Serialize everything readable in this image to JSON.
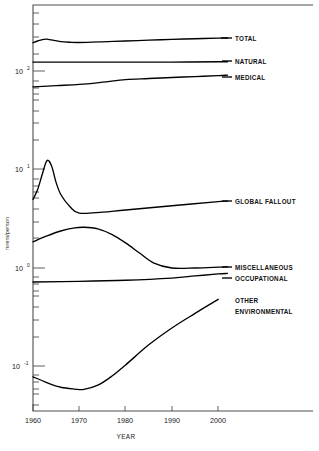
{
  "chart_data": {
    "type": "line",
    "title": "",
    "subtitle": "",
    "xlabel": "YEAR",
    "ylabel": "mrem/person",
    "yscale": "log",
    "xlim": [
      1958,
      2004
    ],
    "ylim": [
      0.04,
      320
    ],
    "grid": false,
    "legend_position": "right-inline-labels",
    "xticks": [
      1960,
      1970,
      1980,
      1990,
      2000
    ],
    "xtick_labels": [
      "1960",
      "1970",
      "1980",
      "1990",
      "2000"
    ],
    "yticks": [
      0.1,
      1,
      10,
      100
    ],
    "ytick_labels": [
      "10-1",
      "100",
      "101",
      "102"
    ],
    "ytick_base": [
      "10",
      "10",
      "10",
      "10"
    ],
    "ytick_exp": [
      "-1",
      "0",
      "1",
      "2"
    ],
    "minor_ticks": true,
    "series": [
      {
        "name": "TOTAL",
        "label": "TOTAL",
        "x": [
          1960,
          1961,
          1962,
          1963,
          1964,
          1966,
          1968,
          1970,
          1975,
          1980,
          1985,
          1990,
          1995,
          2000,
          2002
        ],
        "values": [
          197,
          205,
          212,
          214,
          210,
          202,
          199,
          198,
          201,
          205,
          209,
          213,
          216,
          219,
          220
        ]
      },
      {
        "name": "NATURAL",
        "label": "NATURAL",
        "x": [
          1960,
          1970,
          1980,
          1990,
          2000,
          2002
        ],
        "values": [
          125,
          125,
          125,
          125,
          126,
          126
        ]
      },
      {
        "name": "MEDICAL",
        "label": "MEDICAL",
        "x": [
          1960,
          1965,
          1970,
          1975,
          1980,
          1985,
          1990,
          1995,
          2000,
          2002
        ],
        "values": [
          70,
          72,
          74,
          78,
          83,
          85,
          87,
          89,
          91,
          92
        ]
      },
      {
        "name": "GLOBAL FALLOUT",
        "label": "GLOBAL FALLOUT",
        "x": [
          1960,
          1961,
          1962,
          1963,
          1964,
          1965,
          1966,
          1968,
          1970,
          1975,
          1980,
          1990,
          2000,
          2002
        ],
        "values": [
          5.0,
          6.3,
          9.0,
          12.4,
          11.0,
          7.4,
          5.6,
          4.2,
          3.62,
          3.7,
          3.9,
          4.3,
          4.75,
          4.8
        ]
      },
      {
        "name": "MISCELLANEOUS",
        "label": "MISCELLANEOUS",
        "x": [
          1960,
          1963,
          1966,
          1969,
          1971,
          1974,
          1977,
          1980,
          1983,
          1986,
          1990,
          1995,
          2000,
          2002
        ],
        "values": [
          1.85,
          2.12,
          2.38,
          2.56,
          2.6,
          2.5,
          2.2,
          1.8,
          1.42,
          1.13,
          1.0,
          1.0,
          1.02,
          1.03
        ]
      },
      {
        "name": "OCCUPATIONAL",
        "label": "OCCUPATIONAL",
        "x": [
          1960,
          1970,
          1980,
          1990,
          1995,
          2000,
          2002
        ],
        "values": [
          0.72,
          0.73,
          0.75,
          0.79,
          0.83,
          0.87,
          0.88
        ]
      },
      {
        "name": "OTHER ENVIRONMENTAL",
        "label_line1": "OTHER",
        "label_line2": "ENVIRONMENTAL",
        "x": [
          1960,
          1963,
          1966,
          1969,
          1971,
          1974,
          1977,
          1980,
          1985,
          1990,
          1995,
          2000
        ],
        "values": [
          0.078,
          0.068,
          0.061,
          0.0585,
          0.058,
          0.064,
          0.079,
          0.103,
          0.165,
          0.245,
          0.345,
          0.48
        ]
      }
    ],
    "annotations": []
  }
}
